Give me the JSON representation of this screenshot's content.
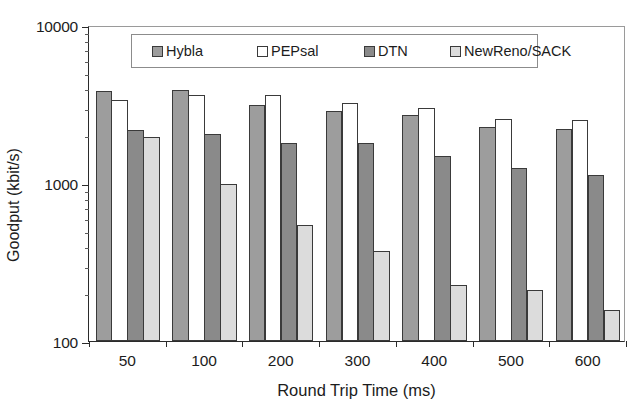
{
  "chart_data": {
    "type": "bar",
    "title": "",
    "xlabel": "Round Trip Time (ms)",
    "ylabel": "Goodput (kbit/s)",
    "yscale": "log",
    "ylim": [
      100,
      10000
    ],
    "ytick_labels": [
      "10000",
      "1000",
      "100"
    ],
    "ytick_values": [
      10000,
      1000,
      100
    ],
    "grid": false,
    "legend_position": "top-center",
    "categories": [
      "50",
      "100",
      "200",
      "300",
      "400",
      "500",
      "600"
    ],
    "series": [
      {
        "name": "Hybla",
        "color": "#9d9d9d",
        "values": [
          3800,
          3900,
          3100,
          2850,
          2700,
          2250,
          2200
        ]
      },
      {
        "name": "PEPsal",
        "color": "#ffffff",
        "values": [
          3350,
          3600,
          3600,
          3200,
          3000,
          2550,
          2500
        ]
      },
      {
        "name": "DTN",
        "color": "#8a8a8a",
        "values": [
          2150,
          2050,
          1800,
          1780,
          1480,
          1250,
          1130
        ]
      },
      {
        "name": "NewReno/SACK",
        "color": "#dcdcdc",
        "values": [
          1950,
          980,
          540,
          370,
          225,
          210,
          158
        ]
      }
    ]
  },
  "legend": {
    "items": [
      {
        "label": "Hybla",
        "swatch": "hybla-swatch"
      },
      {
        "label": "PEPsal",
        "swatch": "pepsal-swatch"
      },
      {
        "label": "DTN",
        "swatch": "dtn-swatch"
      },
      {
        "label": "NewReno/SACK",
        "swatch": "newreno-sack-swatch"
      }
    ]
  }
}
